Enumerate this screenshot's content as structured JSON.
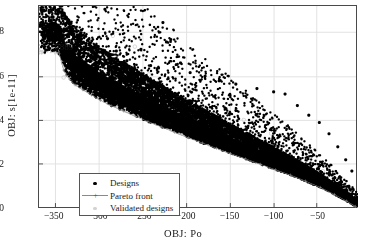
{
  "chart_data": {
    "type": "scatter",
    "title": "",
    "xlabel": "OBJ: Po",
    "ylabel": "OBJ: s[1e-11]",
    "xlim": [
      -368,
      -5
    ],
    "ylim": [
      0,
      0.92
    ],
    "xticks": [
      -350,
      -300,
      -250,
      -200,
      -150,
      -100,
      -50
    ],
    "xtick_labels": [
      "−350",
      "−300",
      "−250",
      "−200",
      "−150",
      "−100",
      "−50"
    ],
    "yticks": [
      0,
      0.2,
      0.4,
      0.6,
      0.8
    ],
    "ytick_labels": [
      "0",
      "0.2",
      "0.4",
      "0.6",
      "0.8"
    ],
    "grid": true,
    "legend_position": "lower left",
    "annotations": [
      {
        "text": "7889",
        "x": -345,
        "y": 0.705
      }
    ],
    "series": [
      {
        "name": "Designs",
        "marker": "filled-circle",
        "color": "#000000",
        "description": "Dense descending wedge of design points from upper-left to lower-right, sharp lower Pareto-like boundary with diffuse upper scatter and sparse high outliers.",
        "n_points_approx": 9000,
        "outliers": [
          [
            -293,
            0.905
          ],
          [
            -227,
            0.845
          ],
          [
            -336,
            0.812
          ],
          [
            -290,
            0.772
          ],
          [
            -218,
            0.768
          ],
          [
            -223,
            0.757
          ],
          [
            -345,
            0.703
          ],
          [
            -306,
            0.733
          ],
          [
            -252,
            0.724
          ],
          [
            -280,
            0.716
          ],
          [
            -331,
            0.714
          ],
          [
            -339,
            0.706
          ],
          [
            -334,
            0.676
          ],
          [
            -268,
            0.672
          ],
          [
            -207,
            0.662
          ],
          [
            -296,
            0.655
          ],
          [
            -241,
            0.65
          ],
          [
            -318,
            0.644
          ],
          [
            -259,
            0.633
          ],
          [
            -286,
            0.628
          ],
          [
            -232,
            0.639
          ],
          [
            -196,
            0.618
          ],
          [
            -179,
            0.602
          ],
          [
            -163,
            0.581
          ],
          [
            -144,
            0.566
          ],
          [
            -120,
            0.546
          ],
          [
            -101,
            0.531
          ],
          [
            -88,
            0.521
          ],
          [
            -74,
            0.469
          ],
          [
            -61,
            0.425
          ],
          [
            -49,
            0.392
          ],
          [
            -38,
            0.341
          ],
          [
            -28,
            0.282
          ],
          [
            -19,
            0.223
          ],
          [
            -12,
            0.172
          ]
        ]
      },
      {
        "name": "Pareto front",
        "marker": "plus",
        "line": true,
        "color": "#8a8a8a",
        "description": "Thin connected front tracing the lower-left envelope of the design cloud.",
        "points": [
          [
            -345,
            0.703
          ],
          [
            -340,
            0.63
          ],
          [
            -337,
            0.605
          ],
          [
            -333,
            0.588
          ],
          [
            -327,
            0.562
          ],
          [
            -318,
            0.54
          ],
          [
            -308,
            0.516
          ],
          [
            -298,
            0.492
          ],
          [
            -286,
            0.468
          ],
          [
            -272,
            0.444
          ],
          [
            -258,
            0.42
          ],
          [
            -244,
            0.396
          ],
          [
            -229,
            0.372
          ],
          [
            -214,
            0.348
          ],
          [
            -198,
            0.323
          ],
          [
            -182,
            0.299
          ],
          [
            -166,
            0.275
          ],
          [
            -150,
            0.251
          ],
          [
            -133,
            0.227
          ],
          [
            -116,
            0.203
          ],
          [
            -99,
            0.178
          ],
          [
            -82,
            0.154
          ],
          [
            -65,
            0.127
          ],
          [
            -48,
            0.098
          ],
          [
            -32,
            0.066
          ],
          [
            -18,
            0.036
          ],
          [
            -8,
            0.012
          ]
        ]
      },
      {
        "name": "Validated designs",
        "marker": "open-circle",
        "color": "#d2d2d2",
        "description": "Sparse faint light-gray markers scattered among and above the design cloud.",
        "points": [
          [
            -361,
            0.862
          ],
          [
            -284,
            0.785
          ],
          [
            -259,
            0.736
          ],
          [
            -305,
            0.69
          ],
          [
            -340,
            0.596
          ],
          [
            -321,
            0.553
          ],
          [
            -243,
            0.61
          ],
          [
            -198,
            0.54
          ],
          [
            -166,
            0.468
          ],
          [
            -135,
            0.404
          ],
          [
            -104,
            0.343
          ],
          [
            -75,
            0.27
          ],
          [
            -45,
            0.172
          ],
          [
            -22,
            0.088
          ]
        ]
      }
    ]
  },
  "figure": {
    "background": "#ffffff",
    "axis_color": "#4a4a4a",
    "grid_color": "#e2e2e2",
    "designs_color": "#000000",
    "pareto_color": "#8a8a8a",
    "validated_color": "#d2d2d2"
  },
  "legend": {
    "items": [
      {
        "label": "Designs",
        "marker": "filled-circle"
      },
      {
        "label": "Pareto front",
        "marker": "line-plus"
      },
      {
        "label": "Validated designs",
        "marker": "faint-circle"
      }
    ]
  }
}
